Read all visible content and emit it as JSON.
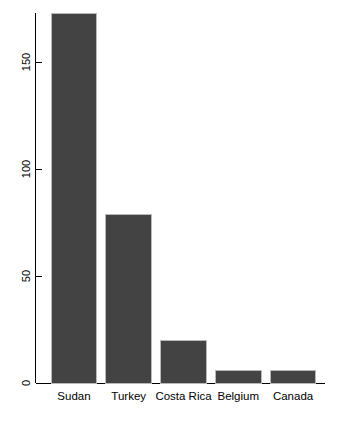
{
  "chart_data": {
    "type": "bar",
    "title": "",
    "subtitle": "",
    "xlabel": "",
    "ylabel": "",
    "categories": [
      "Sudan",
      "Turkey",
      "Costa Rica",
      "Belgium",
      "Canada"
    ],
    "values": [
      173,
      79,
      20,
      6,
      6
    ],
    "series": [
      {
        "name": "",
        "values": [
          173,
          79,
          20,
          6,
          6
        ]
      }
    ],
    "ylim": [
      0,
      173
    ],
    "xlim": [
      0,
      5
    ],
    "ytick_labels": [
      "0",
      "50",
      "100",
      "150"
    ],
    "ytick_values": [
      0,
      50,
      100,
      150
    ],
    "ytick_rotation": 90,
    "xtick_labels": [
      "Sudan",
      "Turkey",
      "Costa Rica",
      "Belgium",
      "Canada"
    ],
    "grid": false,
    "legend": false,
    "legend_position": "none",
    "annotations": [],
    "colors": {
      "bar_fill": "#434343",
      "bar_border": "#b9b9b9",
      "axis": "#000000",
      "text": "#000000",
      "background": "#ffffff"
    }
  },
  "axes": {
    "y_axis_name": "y-axis",
    "x_axis_name": "x-axis"
  }
}
